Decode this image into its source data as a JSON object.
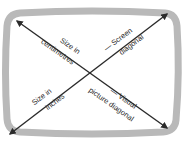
{
  "diagram": {
    "type": "screen-diagonal-illustration",
    "colors": {
      "frame": "#b9b9b9",
      "arrow": "#2b2b2b",
      "text": "#2a2a2a",
      "background": "#ffffff"
    },
    "labels": {
      "size_cm_line1": "Size in",
      "size_cm_line2": "centimetres",
      "screen_diag_line1": "— Screen",
      "screen_diag_line2": "diagonal",
      "size_in_line1": "Size in",
      "size_in_line2": "inches",
      "visual_diag_line1": "— Visual",
      "visual_diag_line2": "picture diagonal"
    },
    "arrows": [
      {
        "name": "top-left-to-bottom-right",
        "from": [
          17,
          21
        ],
        "to": [
          167,
          128
        ]
      },
      {
        "name": "bottom-left-to-top-right",
        "from": [
          10,
          134
        ],
        "to": [
          167,
          14
        ]
      }
    ]
  }
}
